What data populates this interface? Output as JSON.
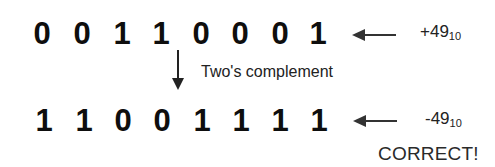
{
  "top_row": {
    "bits": [
      "0",
      "0",
      "1",
      "1",
      "0",
      "0",
      "0",
      "1"
    ],
    "value": "+49",
    "base": "10"
  },
  "operation": {
    "label": "Two's complement",
    "icon": "down-arrow-icon"
  },
  "bottom_row": {
    "bits": [
      "1",
      "1",
      "0",
      "0",
      "1",
      "1",
      "1",
      "1"
    ],
    "value": "-49",
    "base": "10"
  },
  "verdict": "CORRECT!",
  "icons": {
    "row_pointer": "left-arrow-icon"
  }
}
